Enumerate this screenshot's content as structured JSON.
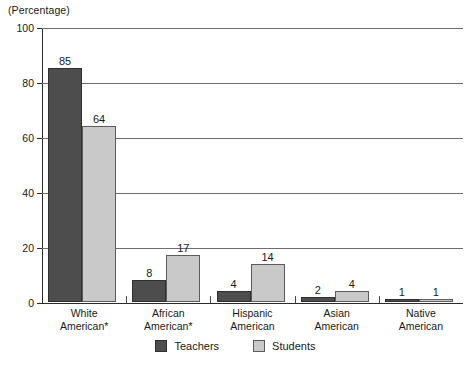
{
  "chart_data": {
    "type": "bar",
    "title": "",
    "subtitle": "",
    "unit_caption": "(Percentage)",
    "xlabel": "",
    "ylabel": "",
    "ylim": [
      0,
      100
    ],
    "yticks": [
      0,
      20,
      40,
      60,
      80,
      100
    ],
    "ytick_labels": [
      "0",
      "20",
      "40",
      "60",
      "80",
      "100"
    ],
    "grid": true,
    "grid_axis": "y",
    "legend_position": "bottom-center",
    "categories": [
      "White American*",
      "African American*",
      "Hispanic American",
      "Asian American",
      "Native American"
    ],
    "category_lines": [
      [
        "White",
        "American*"
      ],
      [
        "African",
        "American*"
      ],
      [
        "Hispanic",
        "American"
      ],
      [
        "Asian",
        "American"
      ],
      [
        "Native",
        "American"
      ]
    ],
    "series": [
      {
        "name": "Teachers",
        "color": "#4d4d4d",
        "values": [
          85,
          8,
          4,
          2,
          1
        ],
        "value_labels": [
          "85",
          "8",
          "4",
          "2",
          "1"
        ]
      },
      {
        "name": "Students",
        "color": "#c9c9c9",
        "values": [
          64,
          17,
          14,
          4,
          1
        ],
        "value_labels": [
          "64",
          "17",
          "14",
          "4",
          "1"
        ]
      }
    ]
  },
  "legend": {
    "items": [
      {
        "label": "Teachers",
        "color": "#4d4d4d"
      },
      {
        "label": "Students",
        "color": "#c9c9c9"
      }
    ]
  }
}
